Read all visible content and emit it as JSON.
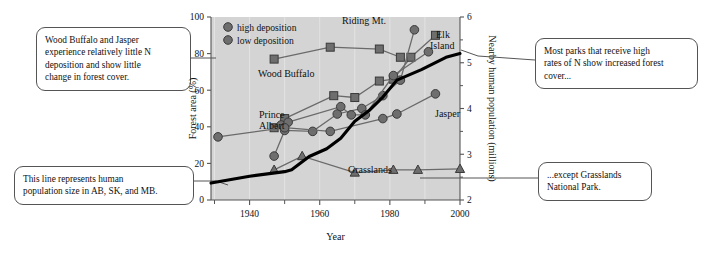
{
  "figure": {
    "background": "#ffffff",
    "plot_background": "#d4d4d4",
    "marker_color": "#6e6e6e",
    "marker_stroke": "#3a3a3a",
    "population_line_color": "#000000"
  },
  "callouts": {
    "top_left": {
      "name": "callout-wood-buffalo-jasper",
      "lines": [
        "Wood Buffalo and Jasper",
        "experience relatively little N",
        "deposition and show little",
        "change in forest cover."
      ]
    },
    "top_right": {
      "name": "callout-high-n-parks",
      "lines": [
        "Most parks that receive high",
        "rates of N show increased forest",
        "cover..."
      ]
    },
    "bottom_left": {
      "name": "callout-population-line",
      "lines": [
        "This line represents human",
        "population size in AB, SK, and MB."
      ]
    },
    "bottom_right": {
      "name": "callout-grasslands-exception",
      "lines": [
        "...except Grasslands",
        "National Park."
      ]
    }
  },
  "chart_data": {
    "type": "line",
    "title": "",
    "xlabel": "Year",
    "ylabel": "Forest area (%)",
    "y2label": "Nearby human population (millions)",
    "xlim": [
      1929,
      2000
    ],
    "ylim": [
      0,
      100
    ],
    "y2lim": [
      2,
      6
    ],
    "xticks": [
      1940,
      1960,
      1980,
      2000
    ],
    "xticks_minor": [
      1930,
      1950,
      1970,
      1990
    ],
    "yticks": [
      0,
      20,
      40,
      60,
      80,
      100
    ],
    "y2ticks": [
      2,
      3,
      4,
      5,
      6
    ],
    "y2ticks_minor": [
      2.5,
      3.5,
      4.5,
      5.5
    ],
    "grid": "vertical",
    "legend": {
      "position": "top-left-inside",
      "entries": [
        {
          "label": "high deposition",
          "marker": "circle"
        },
        {
          "label": "low deposition",
          "marker": "circle"
        }
      ]
    },
    "series": [
      {
        "name": "Wood Buffalo",
        "label": "Wood Buffalo",
        "marker": "square",
        "deposition": "low",
        "x": [
          1947,
          1963,
          1977,
          1983
        ],
        "y": [
          77,
          83.5,
          82.5,
          78
        ]
      },
      {
        "name": "Prince Albert",
        "label": "Prince Albert",
        "marker": "square",
        "deposition": "high",
        "x": [
          1947,
          1950,
          1964,
          1970,
          1977,
          1981,
          1986,
          1993
        ],
        "y": [
          39.5,
          44.5,
          57,
          56,
          65,
          66,
          78,
          90
        ]
      },
      {
        "name": "Riding Mt.",
        "label": "Riding Mt.",
        "marker": "circle",
        "deposition": "high",
        "x": [
          1947,
          1950,
          1958,
          1965,
          1972,
          1978,
          1983,
          1987
        ],
        "y": [
          24,
          38,
          37.5,
          47,
          50,
          57,
          65.5,
          93
        ]
      },
      {
        "name": "Elk Island",
        "label": "Elk Island",
        "marker": "circle",
        "deposition": "high",
        "x": [
          1949,
          1951,
          1966,
          1969,
          1973,
          1981,
          1991
        ],
        "y": [
          41,
          42.5,
          51,
          46.5,
          46.5,
          68,
          81
        ]
      },
      {
        "name": "Jasper",
        "label": "Jasper",
        "marker": "circle",
        "deposition": "low",
        "x": [
          1931,
          1950,
          1963,
          1978,
          1982,
          1993
        ],
        "y": [
          34.5,
          39.5,
          37.5,
          44.5,
          47,
          58
        ]
      },
      {
        "name": "Grasslands",
        "label": "Grasslands",
        "marker": "triangle",
        "deposition": "low",
        "x": [
          1947,
          1955,
          1970,
          1981,
          1988,
          2000
        ],
        "y": [
          16.5,
          24,
          15,
          16.5,
          16.5,
          17
        ]
      }
    ],
    "population_line": {
      "name": "Nearby human population",
      "x": [
        1929,
        1940,
        1950,
        1952,
        1957,
        1962,
        1966,
        1970,
        1974,
        1978,
        1982,
        1989,
        1996,
        2000
      ],
      "y2": [
        2.37,
        2.52,
        2.62,
        2.66,
        2.95,
        3.12,
        3.35,
        3.72,
        3.95,
        4.25,
        4.62,
        4.85,
        5.12,
        5.2
      ]
    }
  }
}
